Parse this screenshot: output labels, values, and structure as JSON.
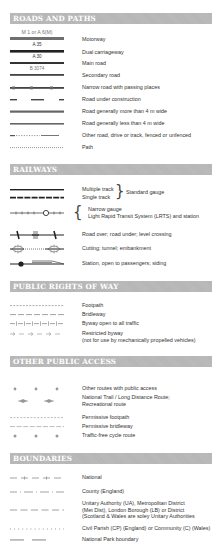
{
  "sections": {
    "roads": {
      "title": "ROADS AND PATHS",
      "items": [
        {
          "code": "M 1 or A 6(M)",
          "label": "Motorway"
        },
        {
          "code": "A 35",
          "label": "Dual carriageway"
        },
        {
          "code": "A 30",
          "label": "Main road"
        },
        {
          "code": "B 3074",
          "label": "Secondary road"
        },
        {
          "label": "Narrow road with passing places"
        },
        {
          "label": "Road under construction"
        },
        {
          "label": "Road generally more than 4 m wide"
        },
        {
          "label": "Road generally less than 4 m wide"
        },
        {
          "label": "Other road, drive or track, fenced or unfenced"
        },
        {
          "label": "Path"
        }
      ]
    },
    "railways": {
      "title": "RAILWAYS",
      "items": [
        {
          "label": "Multiple track"
        },
        {
          "label": "Single track"
        },
        {
          "group": "Standard gauge"
        },
        {
          "label": "Narrow gauge"
        },
        {
          "label": "Light Rapid Transit System (LRTS) and station"
        },
        {
          "label": "Road over; road under; level crossing"
        },
        {
          "label": "Cutting; tunnel; embankment"
        },
        {
          "label": "Station, open to passengers; siding"
        }
      ]
    },
    "rights_of_way": {
      "title": "PUBLIC RIGHTS OF WAY",
      "items": [
        {
          "label": "Footpath"
        },
        {
          "label": "Bridleway"
        },
        {
          "label": "Byway open to all traffic"
        },
        {
          "label": "Restricted byway",
          "note": "(not for use by mechanically propelled vehicles)"
        }
      ]
    },
    "other_access": {
      "title": "OTHER PUBLIC ACCESS",
      "items": [
        {
          "label": "Other routes with public access"
        },
        {
          "label": "National Trail / Long Distance Route;",
          "line2": "Recreational route"
        },
        {
          "label": "Permissive footpath"
        },
        {
          "label": "Permissive bridleway"
        },
        {
          "label": "Traffic-free cycle route"
        }
      ]
    },
    "boundaries": {
      "title": "BOUNDARIES",
      "items": [
        {
          "label": "National"
        },
        {
          "label": "County (England)"
        },
        {
          "label": "Unitary Authority (UA), Metropolitan District",
          "line2": "(Met Dist), London Borough (LB) or District",
          "line3": "(Scotland & Wales are soley Unitary Authorities"
        },
        {
          "label": "Civil Parish (CP) (England) or Community (C) (Wales)"
        },
        {
          "label": "National Park boundary"
        }
      ]
    }
  },
  "colors": {
    "header_bg": "#b5b5b5",
    "line_dark": "#3a3a3a",
    "line_grey": "#8a8a8a"
  }
}
